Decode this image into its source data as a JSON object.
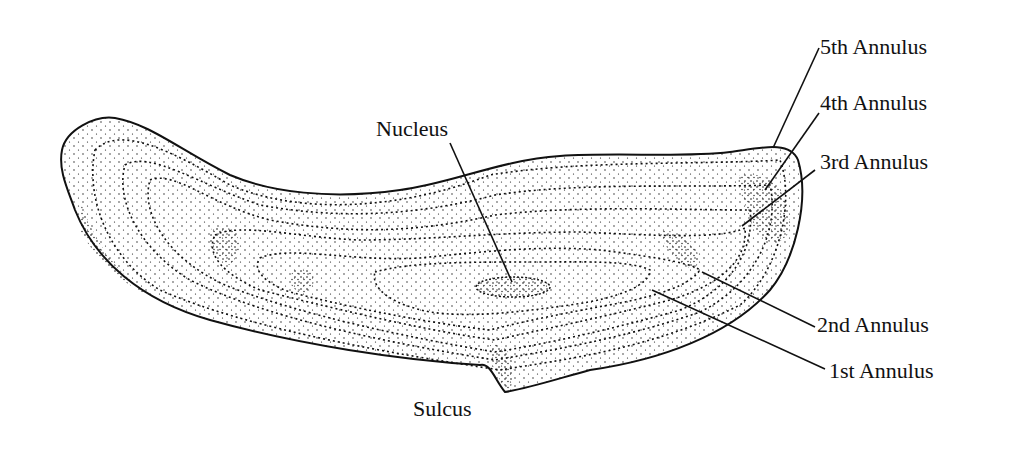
{
  "figure": {
    "colors": {
      "ink": "#111111",
      "background": "#ffffff"
    },
    "labels": {
      "nucleus": "Nucleus",
      "sulcus": "Sulcus",
      "annulus_5": "5th Annulus",
      "annulus_4": "4th Annulus",
      "annulus_3": "3rd Annulus",
      "annulus_2": "2nd Annulus",
      "annulus_1": "1st Annulus"
    }
  }
}
